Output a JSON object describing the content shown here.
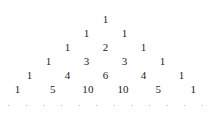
{
  "figure": {
    "name": "pascals-triangle",
    "background_color": "#ffffff",
    "text_color": "#1a1a1a",
    "ellipsis_color": "#b9b9b9",
    "rows": [
      {
        "row_index": 0,
        "top": 12,
        "values": [
          "1"
        ]
      },
      {
        "row_index": 1,
        "top": 26,
        "values": [
          "1",
          "1"
        ]
      },
      {
        "row_index": 2,
        "top": 40,
        "values": [
          "1",
          "2",
          "1"
        ]
      },
      {
        "row_index": 3,
        "top": 54,
        "values": [
          "1",
          "3",
          "3",
          "1"
        ]
      },
      {
        "row_index": 4,
        "top": 68,
        "values": [
          "1",
          "4",
          "6",
          "4",
          "1"
        ]
      },
      {
        "row_index": 5,
        "top": 82,
        "values": [
          "1",
          "5",
          "10",
          "10",
          "5",
          "1"
        ]
      }
    ],
    "ellipsis_row": {
      "top": 96,
      "dots": [
        ".",
        ".",
        ".",
        ".",
        ".",
        ".",
        ".",
        ".",
        ".",
        ".",
        ".",
        "."
      ]
    }
  }
}
